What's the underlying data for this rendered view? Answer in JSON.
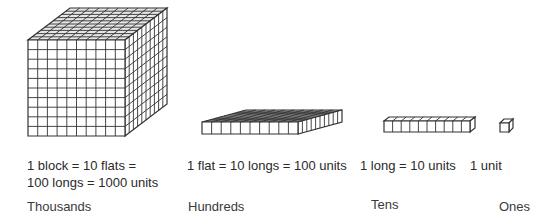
{
  "blocks": [
    {
      "id": "thousands",
      "shape": "block",
      "equation_line1": "1 block = 10 flats =",
      "equation_line2": "100 longs = 1000 units",
      "place": "Thousands"
    },
    {
      "id": "hundreds",
      "shape": "flat",
      "equation_line1": "1 flat = 10 longs = 100 units",
      "place": "Hundreds"
    },
    {
      "id": "tens",
      "shape": "long",
      "equation_line1": "1 long = 10 units",
      "place": "Tens"
    },
    {
      "id": "ones",
      "shape": "unit",
      "equation_line1": "1 unit",
      "place": "Ones"
    }
  ],
  "style": {
    "line_color": "#333333",
    "background": "#ffffff"
  }
}
